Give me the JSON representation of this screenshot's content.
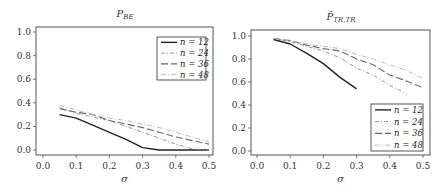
{
  "chart_data": [
    {
      "type": "line",
      "title": "P_BE",
      "title_main": "P",
      "title_sub": "BE",
      "xlabel": "σ",
      "ylabel": "",
      "xlim": [
        0.0,
        0.5
      ],
      "ylim": [
        0.0,
        1.0
      ],
      "xticks": [
        "0.0",
        "0.1",
        "0.2",
        "0.3",
        "0.4",
        "0.5"
      ],
      "yticks": [
        "0.0",
        "0.2",
        "0.4",
        "0.6",
        "0.8",
        "1.0"
      ],
      "grid": false,
      "legend_position": "upper right",
      "x": [
        0.05,
        0.1,
        0.15,
        0.2,
        0.25,
        0.3,
        0.35,
        0.4,
        0.45,
        0.5
      ],
      "series": [
        {
          "name": "n = 12",
          "style": "solid",
          "color": "#222222",
          "values": [
            0.3,
            0.27,
            0.21,
            0.15,
            0.09,
            0.02,
            0.0,
            0.0,
            0.0,
            0.0
          ]
        },
        {
          "name": "n = 24",
          "style": "dashdot",
          "color": "#8a8a8a",
          "values": [
            0.36,
            0.31,
            0.28,
            0.25,
            0.2,
            0.15,
            0.1,
            0.05,
            0.01,
            0.0
          ]
        },
        {
          "name": "n = 36",
          "style": "longdash",
          "color": "#666666",
          "values": [
            0.35,
            0.32,
            0.3,
            0.25,
            0.22,
            0.19,
            0.15,
            0.11,
            0.08,
            0.05
          ]
        },
        {
          "name": "n = 48",
          "style": "dashdot-light",
          "color": "#bdbdbd",
          "values": [
            0.38,
            0.34,
            0.3,
            0.27,
            0.25,
            0.22,
            0.19,
            0.15,
            0.11,
            0.07
          ]
        }
      ]
    },
    {
      "type": "line",
      "title": "P̂_TR,TR",
      "title_main": "P̂",
      "title_sub": "TR,TR",
      "xlabel": "σ",
      "ylabel": "",
      "xlim": [
        0.0,
        0.5
      ],
      "ylim": [
        0.0,
        1.0
      ],
      "xticks": [
        "0.0",
        "0.1",
        "0.2",
        "0.3",
        "0.4",
        "0.5"
      ],
      "yticks": [
        "0.0",
        "0.2",
        "0.4",
        "0.6",
        "0.8",
        "1.0"
      ],
      "grid": false,
      "legend_position": "lower right",
      "x": [
        0.05,
        0.1,
        0.15,
        0.2,
        0.25,
        0.3,
        0.35,
        0.4,
        0.45,
        0.5
      ],
      "series": [
        {
          "name": "n = 12",
          "style": "solid",
          "color": "#222222",
          "values": [
            0.97,
            0.93,
            0.85,
            0.76,
            0.64,
            0.54,
            null,
            null,
            null,
            null
          ]
        },
        {
          "name": "n = 24",
          "style": "dashdot",
          "color": "#8a8a8a",
          "values": [
            0.98,
            0.95,
            0.91,
            0.87,
            0.81,
            0.72,
            0.66,
            0.57,
            0.5,
            null
          ]
        },
        {
          "name": "n = 36",
          "style": "longdash",
          "color": "#666666",
          "values": [
            0.98,
            0.96,
            0.92,
            0.89,
            0.87,
            0.8,
            0.75,
            0.66,
            0.61,
            0.55
          ]
        },
        {
          "name": "n = 48",
          "style": "dashdot-light",
          "color": "#bdbdbd",
          "values": [
            0.98,
            0.96,
            0.93,
            0.91,
            0.89,
            0.84,
            0.8,
            0.75,
            0.7,
            0.63
          ]
        }
      ]
    }
  ],
  "legend": {
    "labels": [
      "n = 12",
      "n = 24",
      "n = 36",
      "n = 48"
    ]
  }
}
